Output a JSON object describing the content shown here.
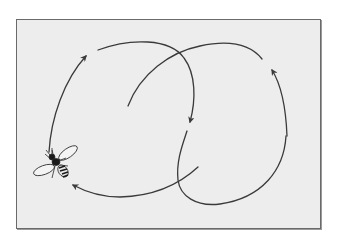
{
  "figure": {
    "colors": {
      "background": "#ffffff",
      "panel": "#ededed",
      "border": "#6a6a6a",
      "stroke": "#3a3a3a"
    },
    "elements": [
      {
        "type": "arrow-path",
        "name": "left-ascending-arc",
        "direction": "up-right"
      },
      {
        "type": "arrow-path",
        "name": "top-descending-arc",
        "direction": "down"
      },
      {
        "type": "path",
        "name": "inner-crossing-arc"
      },
      {
        "type": "arrow-path",
        "name": "right-ascending-arc",
        "direction": "up-left"
      },
      {
        "type": "path",
        "name": "lower-right-loop"
      },
      {
        "type": "arrow-path",
        "name": "bottom-return-arc",
        "direction": "left"
      },
      {
        "type": "icon",
        "name": "bee"
      }
    ]
  }
}
